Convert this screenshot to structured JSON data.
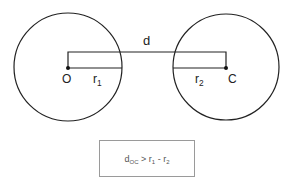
{
  "diagram": {
    "circle_left": {
      "cx": 68,
      "cy": 67,
      "r": 54
    },
    "circle_right": {
      "cx": 226,
      "cy": 67,
      "r": 53
    },
    "stroke_color": "#222222",
    "labels": {
      "distance": "d",
      "center_left": "O",
      "center_right": "C",
      "radius_left_base": "r",
      "radius_left_sub": "1",
      "radius_right_base": "r",
      "radius_right_sub": "2"
    },
    "formula": {
      "lhs_base": "d",
      "lhs_sub": "OC",
      "op": " > ",
      "r1_base": "r",
      "r1_sub": "1",
      "minus": " - ",
      "r2_base": "r",
      "r2_sub": "2"
    }
  }
}
